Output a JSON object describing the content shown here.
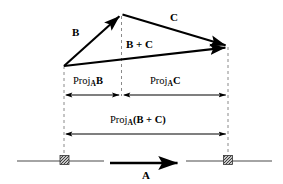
{
  "figure": {
    "ink_color": "#000000",
    "dash_color": "#8a8a8a",
    "labels": {
      "vector_b": "B",
      "vector_c": "C",
      "vector_b_plus_c": "B + C",
      "vector_a": "A",
      "proj_b_prefix": "Proj",
      "proj_b_sub": "A",
      "proj_b_operand": "B",
      "proj_c_prefix": "Proj",
      "proj_c_sub": "A",
      "proj_c_operand": "C",
      "proj_sum_prefix": "Proj",
      "proj_sum_sub": "A",
      "proj_sum_operand": "(B + C)"
    },
    "geometry": {
      "origin": {
        "x": 64,
        "y": 66
      },
      "apex": {
        "x": 121,
        "y": 14
      },
      "terminus": {
        "x": 228,
        "y": 47
      },
      "proj_b_span": [
        64,
        121
      ],
      "proj_c_span": [
        122,
        228
      ],
      "proj_sum_span": [
        64,
        228
      ],
      "proj_row_y": 95,
      "proj_sum_row_y": 134,
      "baseline_y": 161,
      "baseline_left_span": [
        17,
        104
      ],
      "baseline_right_span": [
        186,
        272
      ],
      "vector_a_span": [
        110,
        181
      ],
      "vector_a_y": 163,
      "anchor_left_x": 64,
      "anchor_right_x": 228
    }
  }
}
